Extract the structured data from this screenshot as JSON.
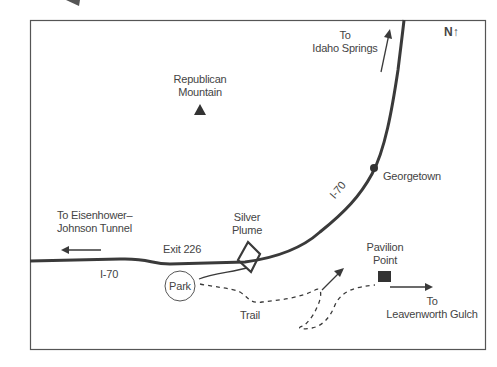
{
  "map": {
    "north_indicator": "N↑",
    "labels": {
      "idaho_springs": [
        "To",
        "Idaho Springs"
      ],
      "republican_mountain": [
        "Republican",
        "Mountain"
      ],
      "georgetown": "Georgetown",
      "eisenhower_tunnel": [
        "To Eisenhower–",
        "Johnson Tunnel"
      ],
      "silver_plume": [
        "Silver",
        "Plume"
      ],
      "exit": "Exit 226",
      "i70_west": "I-70",
      "i70_east": "I-70",
      "park": "Park",
      "trail": "Trail",
      "pavilion_point": [
        "Pavilion",
        "Point"
      ],
      "leavenworth_gulch": [
        "To",
        "Leavenworth Gulch"
      ]
    },
    "colors": {
      "road": "#3a3a3a",
      "border": "#555555",
      "text": "#444444",
      "marker": "#333333"
    }
  }
}
